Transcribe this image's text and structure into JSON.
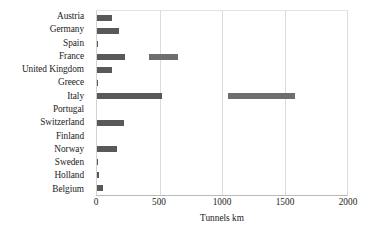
{
  "chart_data": {
    "type": "bar",
    "orientation": "horizontal",
    "title": "",
    "xlabel": "Tunnels km",
    "ylabel": "",
    "xlim": [
      0,
      2000
    ],
    "xticks": [
      0,
      500,
      1000,
      1500,
      2000
    ],
    "xtick_labels": [
      "0",
      "500",
      "1000",
      "1500",
      "2000"
    ],
    "grid": "vertical",
    "legend": "none",
    "bar_color": "#595959",
    "categories": [
      "Austria",
      "Germany",
      "Spain",
      "France",
      "United Kingdom",
      "Greece",
      "Italy",
      "Portugal",
      "Switzerland",
      "Finland",
      "Norway",
      "Sweden",
      "Holland",
      "Belgium"
    ],
    "values": [
      118,
      178,
      10,
      222,
      118,
      10,
      520,
      0,
      218,
      0,
      158,
      10,
      15,
      45
    ],
    "segments": [
      [
        {
          "start": 0,
          "end": 118
        }
      ],
      [
        {
          "start": 0,
          "end": 178
        }
      ],
      [
        {
          "start": 0,
          "end": 10
        }
      ],
      [
        {
          "start": 0,
          "end": 222
        },
        {
          "start": 415,
          "end": 645
        }
      ],
      [
        {
          "start": 0,
          "end": 118
        }
      ],
      [
        {
          "start": 0,
          "end": 10
        }
      ],
      [
        {
          "start": 0,
          "end": 520
        },
        {
          "start": 1050,
          "end": 1580
        }
      ],
      [],
      [
        {
          "start": 0,
          "end": 218
        }
      ],
      [],
      [
        {
          "start": 0,
          "end": 158
        }
      ],
      [
        {
          "start": 0,
          "end": 10
        }
      ],
      [
        {
          "start": 0,
          "end": 15
        }
      ],
      [
        {
          "start": 0,
          "end": 45
        }
      ]
    ]
  }
}
